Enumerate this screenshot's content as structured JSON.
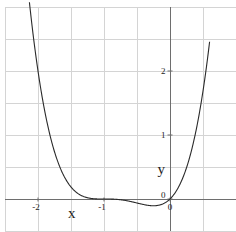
{
  "chart_data": {
    "type": "line",
    "title": "",
    "function": "y = x(x+1)^3",
    "xlabel": "x",
    "ylabel": "y",
    "xlim": [
      -2.5,
      1.0
    ],
    "ylim": [
      -0.5,
      3.0
    ],
    "grid": true,
    "grid_step_x": 0.5,
    "grid_step_y": 0.5,
    "x_ticks": [
      {
        "value": -2,
        "label": "-2"
      },
      {
        "value": -1,
        "label": "-1"
      },
      {
        "value": 0,
        "label": "0"
      }
    ],
    "y_ticks": [
      {
        "value": 0,
        "label": "0"
      },
      {
        "value": 1,
        "label": "1"
      },
      {
        "value": 2,
        "label": "2"
      }
    ],
    "series": [
      {
        "name": "f(x)",
        "color": "#2a2a2a",
        "x": [
          -2.13,
          -2.0,
          -1.75,
          -1.5,
          -1.25,
          -1.0,
          -0.75,
          -0.5,
          -0.25,
          0.0,
          0.25,
          0.5,
          0.6
        ],
        "y": [
          3.06,
          2.0,
          0.79,
          0.19,
          0.02,
          0.0,
          -0.012,
          -0.0625,
          -0.105,
          0.0,
          0.49,
          1.69,
          2.46
        ]
      }
    ]
  }
}
